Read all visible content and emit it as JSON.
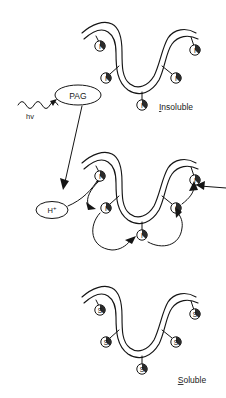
{
  "figure": {
    "type": "diagram",
    "background_color": "#ffffff",
    "line_color": "#151515"
  },
  "light_source": {
    "label": "hv",
    "icon": "wavy-photon-arrow-icon",
    "description": "Incident light (photon) striking the photoacid generator"
  },
  "pag": {
    "label": "PAG",
    "full_name": "photoacid generator",
    "shape": "ellipse"
  },
  "acid": {
    "label": "H",
    "superscript": "+",
    "combined": "H+",
    "shape": "ellipse",
    "description": "Photogenerated acid catalyst"
  },
  "chains": [
    {
      "id": "chain-insoluble",
      "state_label": "Insoluble",
      "state_initial": "I",
      "group_symbol": "I",
      "group_count": 5,
      "description": "Polymer backbone bearing insoluble protecting groups before exposure"
    },
    {
      "id": "chain-reacting",
      "state_label": "",
      "state_initial": "I",
      "group_symbol": "I",
      "group_count": 5,
      "description": "Polymer backbone undergoing acid catalyzed chain deprotection"
    },
    {
      "id": "chain-soluble",
      "state_label": "Soluble",
      "state_initial": "S",
      "group_symbol": "S",
      "group_count": 5,
      "description": "Polymer backbone bearing soluble groups after deprotection"
    }
  ],
  "labels": {
    "insoluble": "Insoluble",
    "soluble": "Soluble"
  },
  "arrows": {
    "photon_to_pag": "hv excites PAG",
    "pag_to_acid": "PAG generates acid",
    "acid_to_chain": "acid attacks protecting group",
    "catalytic_cascade": "acid regenerated and propagates site to site"
  }
}
